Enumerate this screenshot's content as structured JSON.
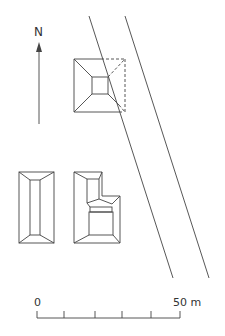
{
  "north_label": "N",
  "scale": {
    "start_label": "0",
    "end_label": "50 m"
  },
  "colors": {
    "line": "#444444",
    "background": "#ffffff"
  }
}
